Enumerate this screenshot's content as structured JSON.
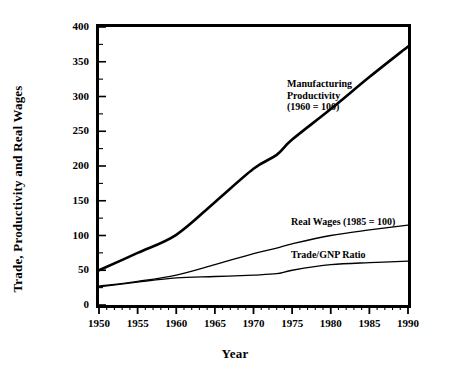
{
  "chart_data": {
    "type": "line",
    "title": "",
    "xlabel": "Year",
    "ylabel": "Trade, Productivity and Real Wages",
    "xlim": [
      1950,
      1990
    ],
    "ylim": [
      0,
      400
    ],
    "xticks": [
      1950,
      1955,
      1960,
      1965,
      1970,
      1975,
      1980,
      1985,
      1990
    ],
    "xticklabels": [
      "1950",
      "1955",
      "1960",
      "1965",
      "1970",
      "1975",
      "1980",
      "1985",
      "1990"
    ],
    "yticks": [
      0,
      50,
      100,
      150,
      200,
      250,
      300,
      350,
      400
    ],
    "yticklabels": [
      "0",
      "50",
      "100",
      "150",
      "200",
      "250",
      "300",
      "350",
      "400"
    ],
    "minor_xtick_interval": 1,
    "minor_ytick_interval": 25,
    "grid": false,
    "legend": "inline-annotations",
    "line_color": "#000000",
    "background": "#ffffff",
    "series": [
      {
        "name": "Manufacturing Productivity (1960 = 100)",
        "annotation": "Manufacturing\nProductivity\n(1960 = 100)",
        "linewidth": 2.6,
        "x": [
          1950,
          1955,
          1960,
          1965,
          1970,
          1973,
          1975,
          1980,
          1985,
          1990
        ],
        "values": [
          50,
          75,
          101,
          148,
          196,
          216,
          238,
          282,
          328,
          372
        ]
      },
      {
        "name": "Real Wages (1985 = 100)",
        "annotation": "Real Wages (1985 = 100)",
        "linewidth": 1.3,
        "x": [
          1950,
          1955,
          1960,
          1965,
          1970,
          1973,
          1975,
          1980,
          1985,
          1990
        ],
        "values": [
          27,
          34,
          43,
          58,
          74,
          82,
          88,
          100,
          108,
          115
        ]
      },
      {
        "name": "Trade/GNP Ratio",
        "annotation": "Trade/GNP Ratio",
        "linewidth": 1.3,
        "x": [
          1950,
          1955,
          1960,
          1965,
          1970,
          1973,
          1975,
          1980,
          1985,
          1990
        ],
        "values": [
          26,
          33,
          39,
          41,
          43,
          45,
          50,
          58,
          61,
          63
        ]
      }
    ],
    "annotations": [
      {
        "key": "manufacturing",
        "text": "Manufacturing\nProductivity\n(1960 = 100)",
        "x_px": 287,
        "y_px": 78
      },
      {
        "key": "real_wages",
        "text": "Real Wages (1985 = 100)",
        "x_px": 291,
        "y_px": 216
      },
      {
        "key": "trade_gnp",
        "text": "Trade/GNP Ratio",
        "x_px": 291,
        "y_px": 249
      }
    ]
  }
}
